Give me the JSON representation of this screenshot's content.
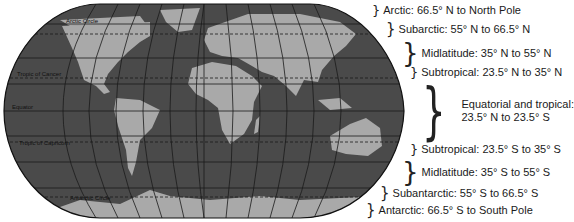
{
  "map": {
    "title": "Latitude climate zones world map",
    "colors": {
      "ocean": "#4a4a4a",
      "land": "#a9a9a9",
      "grid": "#1a1a1a",
      "outline": "#111111"
    },
    "lines": {
      "arctic_circle": "Arctic Circle",
      "tropic_of_cancer": "Tropic of Cancer",
      "equator": "Equator",
      "tropic_of_capricorn": "Tropic of Capricorn",
      "antarctic_circle": "Antarctic Circle"
    }
  },
  "zones": [
    {
      "label": "Arctic: 66.5° N to North Pole"
    },
    {
      "label": "Subarctic: 55° N to 66.5° N"
    },
    {
      "label": "Midlatitude: 35° N to 55° N"
    },
    {
      "label": "Subtropical: 23.5° N to 35° N"
    },
    {
      "label_line1": "Equatorial and tropical:",
      "label_line2": "23.5° N to 23.5° S"
    },
    {
      "label": "Subtropical: 23.5° S to 35° S"
    },
    {
      "label": "Midlatitude: 35° S to 55° S"
    },
    {
      "label": "Subantarctic: 55° S to 66.5° S"
    },
    {
      "label": "Antarctic: 66.5° S to South Pole"
    }
  ]
}
